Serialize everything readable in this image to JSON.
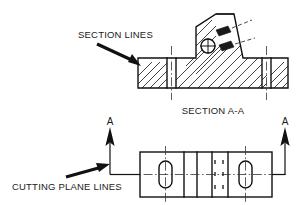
{
  "drawing": {
    "title": "Sectional view engineering drawing",
    "canvas": {
      "width": 308,
      "height": 205,
      "background": "#ffffff"
    },
    "ink_color": "#111111",
    "annotations": {
      "section_lines_label": "SECTION LINES",
      "cutting_plane_label": "CUTTING PLANE LINES",
      "section_view_caption": "SECTION A-A",
      "cut_letter_left": "A",
      "cut_letter_right": "A"
    },
    "section_view": {
      "name": "SECTION A-A",
      "hatch_angle_deg": 45,
      "hatch_count": 14,
      "features": [
        {
          "name": "base-flange",
          "type": "rectangle"
        },
        {
          "name": "upright-trapezoid",
          "type": "trapezoid"
        },
        {
          "name": "bore-circle",
          "type": "circle-with-crosshair"
        },
        {
          "name": "slot-left",
          "type": "unhatched-band"
        },
        {
          "name": "slot-right",
          "type": "unhatched-band"
        },
        {
          "name": "detail-tag-upper",
          "type": "hatched-tag"
        },
        {
          "name": "detail-tag-lower",
          "type": "hatched-tag"
        }
      ]
    },
    "plan_view": {
      "name": "top-view",
      "features": [
        {
          "name": "slot-left",
          "type": "obround"
        },
        {
          "name": "slot-right",
          "type": "obround"
        },
        {
          "name": "rib-band",
          "type": "hidden-line-band"
        },
        {
          "name": "divider-lines",
          "count": 4
        }
      ],
      "hidden_dash_rows": 3,
      "hidden_dash_cols": 2
    }
  }
}
